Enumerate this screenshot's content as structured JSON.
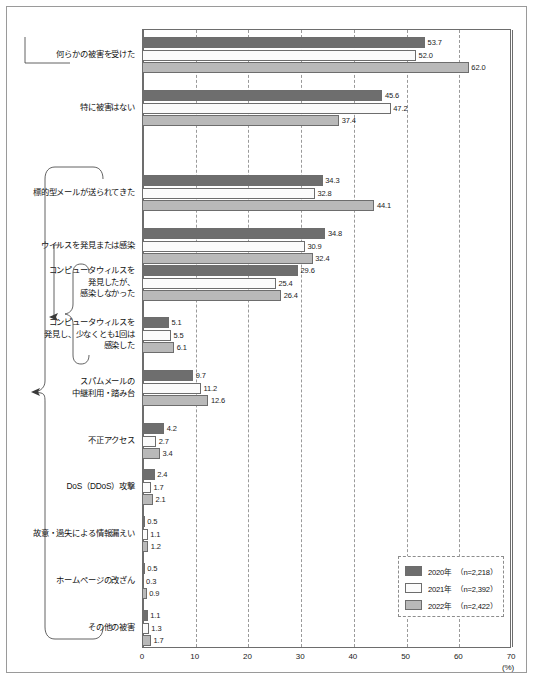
{
  "chart_data": {
    "type": "bar",
    "orientation": "horizontal",
    "title": "",
    "xlabel": "(%)",
    "ylabel": "",
    "xlim": [
      0,
      70
    ],
    "xticks": [
      0,
      10,
      20,
      30,
      40,
      50,
      60,
      70
    ],
    "xtick_labels": [
      "0",
      "10",
      "20",
      "30",
      "40",
      "50",
      "60",
      "70"
    ],
    "unit": "(%)",
    "grid": "vertical-dashed",
    "legend_position": "bottom-right",
    "categories": [
      "何らかの被害を受けた",
      "特に被害はない",
      "標的型メールが送られてきた",
      "ウイルスを発見または感染",
      "コンピュータウィルスを\n発見したが、\n感染しなかった",
      "コンピュータウィルスを\n発見し、少なくとも1回は\n感染した",
      "スパムメールの\n中継利用・踏み台",
      "不正アクセス",
      "DoS（DDoS）攻撃",
      "故意・過失による情報漏えい",
      "ホームページの改ざん",
      "その他の被害"
    ],
    "series": [
      {
        "name": "2020年",
        "legend_label": "2020年 （n=2,218）",
        "n": "2,218",
        "color": "#6e6e6e",
        "values": [
          53.7,
          45.6,
          34.3,
          34.8,
          29.6,
          5.1,
          9.7,
          4.2,
          2.4,
          0.5,
          0.5,
          1.1
        ]
      },
      {
        "name": "2021年",
        "legend_label": "2021年 （n=2,392）",
        "n": "2,392",
        "color": "#fbfbfb",
        "values": [
          52.0,
          47.2,
          32.8,
          30.9,
          25.4,
          5.5,
          11.2,
          2.7,
          1.7,
          1.1,
          0.3,
          1.3
        ]
      },
      {
        "name": "2022年",
        "legend_label": "2022年 （n=2,422）",
        "n": "2,422",
        "color": "#b9b9b9",
        "values": [
          62.0,
          37.4,
          44.1,
          32.4,
          26.4,
          6.1,
          12.6,
          3.4,
          2.1,
          1.2,
          0.9,
          1.7
        ]
      }
    ],
    "value_labels": {
      "何らかの被害を受けた": [
        "53.7",
        "52.0",
        "62.0"
      ],
      "特に被害はない": [
        "45.6",
        "47.2",
        "37.4"
      ],
      "標的型メールが送られてきた": [
        "34.3",
        "32.8",
        "44.1"
      ],
      "ウイルスを発見または感染": [
        "34.8",
        "30.9",
        "32.4"
      ],
      "コンピュータウィルスを発見したが、感染しなかった": [
        "29.6",
        "25.4",
        "26.4"
      ],
      "コンピュータウィルスを発見し、少なくとも1回は感染した": [
        "5.1",
        "5.5",
        "6.1"
      ],
      "スパムメールの中継利用・踏み台": [
        "9.7",
        "11.2",
        "12.6"
      ],
      "不正アクセス": [
        "4.2",
        "2.7",
        "3.4"
      ],
      "DoS（DDoS）攻撃": [
        "2.4",
        "1.7",
        "2.1"
      ],
      "故意・過失による情報漏えい": [
        "0.5",
        "1.1",
        "1.2"
      ],
      "ホームページの改ざん": [
        "0.5",
        "0.3",
        "0.9"
      ],
      "その他の被害": [
        "1.1",
        "1.3",
        "1.7"
      ]
    }
  },
  "legend": {
    "items": [
      {
        "label": "2020年　（n=2,218）",
        "color": "#6e6e6e"
      },
      {
        "label": "2021年　（n=2,392）",
        "color": "#fbfbfb"
      },
      {
        "label": "2022年　（n=2,422）",
        "color": "#b9b9b9"
      }
    ]
  },
  "axis": {
    "ticks": [
      "0",
      "10",
      "20",
      "30",
      "40",
      "50",
      "60",
      "70"
    ],
    "unit": "(%)"
  },
  "footer": {
    "caption": ""
  }
}
